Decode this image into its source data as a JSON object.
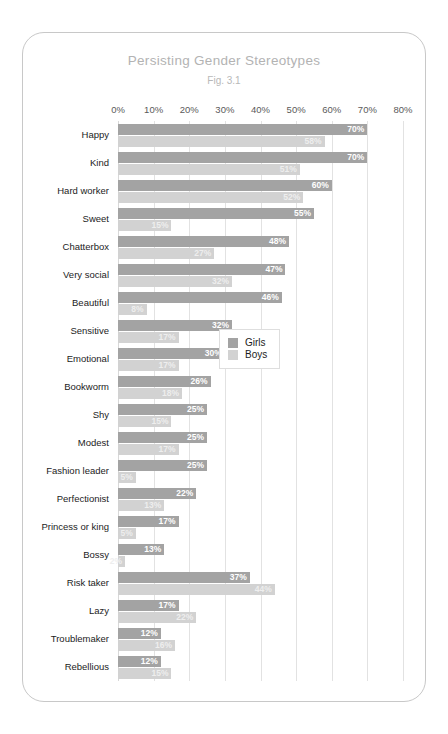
{
  "chart_data": {
    "type": "bar",
    "orientation": "horizontal",
    "title": "Persisting Gender Stereotypes",
    "subtitle": "Fig. 3.1",
    "xlabel": "",
    "ylabel": "",
    "xlim": [
      0,
      80
    ],
    "xticks": [
      "0%",
      "10%",
      "20%",
      "30%",
      "40%",
      "50%",
      "60%",
      "70%",
      "80%"
    ],
    "xtick_values": [
      0,
      10,
      20,
      30,
      40,
      50,
      60,
      70,
      80
    ],
    "grid": true,
    "legend_position": "middle-right",
    "categories": [
      "Happy",
      "Kind",
      "Hard worker",
      "Sweet",
      "Chatterbox",
      "Very social",
      "Beautiful",
      "Sensitive",
      "Emotional",
      "Bookworm",
      "Shy",
      "Modest",
      "Fashion leader",
      "Perfectionist",
      "Princess or king",
      "Bossy",
      "Risk taker",
      "Lazy",
      "Troublemaker",
      "Rebellious"
    ],
    "series": [
      {
        "name": "Girls",
        "color": "#a3a3a3",
        "values": [
          70,
          70,
          60,
          55,
          48,
          47,
          46,
          32,
          30,
          26,
          25,
          25,
          25,
          22,
          17,
          13,
          37,
          17,
          12,
          12
        ],
        "labels": [
          "70%",
          "70%",
          "60%",
          "55%",
          "48%",
          "47%",
          "46%",
          "32%",
          "30%",
          "26%",
          "25%",
          "25%",
          "25%",
          "22%",
          "17%",
          "13%",
          "37%",
          "17%",
          "12%",
          "12%"
        ]
      },
      {
        "name": "Boys",
        "color": "#d2d2d2",
        "values": [
          58,
          51,
          52,
          15,
          27,
          32,
          8,
          17,
          17,
          18,
          15,
          17,
          5,
          13,
          5,
          2,
          44,
          22,
          16,
          15
        ],
        "labels": [
          "58%",
          "51%",
          "52%",
          "15%",
          "27%",
          "32%",
          "8%",
          "17%",
          "17%",
          "18%",
          "15%",
          "17%",
          "5%",
          "13%",
          "5%",
          "2%",
          "44%",
          "22%",
          "16%",
          "15%"
        ]
      }
    ]
  },
  "legend": {
    "items": [
      {
        "label": "Girls",
        "color": "#a3a3a3"
      },
      {
        "label": "Boys",
        "color": "#d2d2d2"
      }
    ]
  },
  "colors": {
    "girls": "#a3a3a3",
    "boys": "#d2d2d2",
    "grid": "#e2e2e2",
    "card_border": "#c8c8c8",
    "title": "#b3b3b3"
  }
}
